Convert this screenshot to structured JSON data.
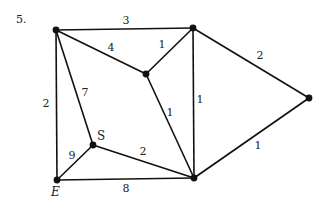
{
  "problem_number": "5.",
  "graph": {
    "nodes": [
      {
        "id": "TL",
        "label": "",
        "x": 56,
        "y": 30
      },
      {
        "id": "TR",
        "label": "",
        "x": 193,
        "y": 28
      },
      {
        "id": "C",
        "label": "",
        "x": 146,
        "y": 74
      },
      {
        "id": "R",
        "label": "",
        "x": 309,
        "y": 98
      },
      {
        "id": "S",
        "label": "S",
        "x": 93,
        "y": 145
      },
      {
        "id": "E",
        "label": "E",
        "x": 57,
        "y": 180
      },
      {
        "id": "BR",
        "label": "",
        "x": 194,
        "y": 178
      }
    ],
    "edges": [
      {
        "from": "TL",
        "to": "TR",
        "weight": "3",
        "lx": 126,
        "ly": 24
      },
      {
        "from": "TL",
        "to": "C",
        "weight": "4",
        "lx": 111,
        "ly": 51
      },
      {
        "from": "TR",
        "to": "C",
        "weight": "1",
        "lx": 162,
        "ly": 48
      },
      {
        "from": "TR",
        "to": "R",
        "weight": "2",
        "lx": 260,
        "ly": 59
      },
      {
        "from": "TR",
        "to": "BR",
        "weight": "1",
        "lx": 200,
        "ly": 103
      },
      {
        "from": "C",
        "to": "BR",
        "weight": "1",
        "lx": 170,
        "ly": 116
      },
      {
        "from": "TL",
        "to": "E",
        "weight": "2",
        "lx": 46,
        "ly": 107
      },
      {
        "from": "TL",
        "to": "S",
        "weight": "7",
        "lx": 85,
        "ly": 96
      },
      {
        "from": "S",
        "to": "BR",
        "weight": "2",
        "lx": 143,
        "ly": 155
      },
      {
        "from": "S",
        "to": "E",
        "weight": "9",
        "lx": 72,
        "ly": 159
      },
      {
        "from": "E",
        "to": "BR",
        "weight": "8",
        "lx": 126,
        "ly": 192
      },
      {
        "from": "BR",
        "to": "R",
        "weight": "1",
        "lx": 258,
        "ly": 149
      }
    ],
    "node_label_positions": {
      "S": {
        "x": 97,
        "y": 140
      },
      "E": {
        "x": 51,
        "y": 196
      }
    }
  }
}
